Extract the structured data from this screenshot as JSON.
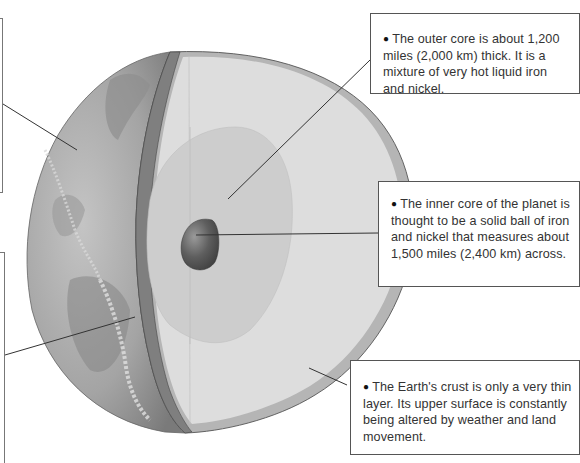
{
  "diagram": {
    "colors": {
      "background": "#ffffff",
      "surface_dark": "#7d7d7d",
      "surface_light": "#b9b9b9",
      "mantle_face": "#dedede",
      "outer_core": "#cfcfcf",
      "inner_core": "#555555",
      "crust_band": "#8a8a8a",
      "leader_line": "#333333",
      "box_border": "#555555"
    },
    "layers": [
      {
        "id": "crust",
        "label": "Crust"
      },
      {
        "id": "mantle",
        "label": "Mantle"
      },
      {
        "id": "outer-core",
        "label": "Outer core"
      },
      {
        "id": "inner-core",
        "label": "Inner core"
      }
    ]
  },
  "callouts": {
    "outer_core": {
      "bullet": "●",
      "text": "The outer core is about 1,200 miles (2,000 km) thick. It is a mixture of very hot liquid iron and nickel."
    },
    "inner_core": {
      "bullet": "●",
      "text": "The inner core of the planet is thought to be a solid ball of iron and nickel that measures about 1,500 miles (2,400 km) across."
    },
    "crust": {
      "bullet": "●",
      "text": "The Earth's crust is only a very thin layer. Its upper surface is constantly being altered by weather and land movement."
    }
  }
}
